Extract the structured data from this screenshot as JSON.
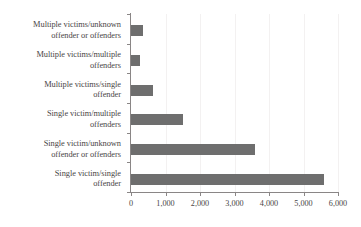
{
  "chart_data": {
    "type": "bar",
    "orientation": "horizontal",
    "title": "",
    "subtitle": "",
    "xlabel": "",
    "ylabel": "",
    "categories": [
      "Multiple victims/unknown\noffender or offenders",
      "Multiple victims/multiple\noffenders",
      "Multiple victims/single\noffender",
      "Single victim/multiple\noffenders",
      "Single victim/unknown\noffender or offenders",
      "Single victim/single\noffender"
    ],
    "values": [
      350,
      250,
      650,
      1500,
      3600,
      5600
    ],
    "xlim": [
      0,
      6000
    ],
    "xticks": [
      0,
      1000,
      2000,
      3000,
      4000,
      5000,
      6000
    ],
    "xtick_labels": [
      "0",
      "1,000",
      "2,000",
      "3,000",
      "4,000",
      "5,000",
      "6,000"
    ],
    "grid": true,
    "grid_axis": "x",
    "legend": false,
    "legend_position": "none",
    "bar_color": "#6e6e6e",
    "gridline_color": "#f3f1f1",
    "axis_color": "#8a8686",
    "text_color": "#4a4646",
    "background_color": "#ffffff"
  }
}
